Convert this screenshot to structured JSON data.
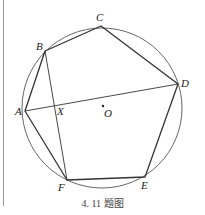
{
  "figure": {
    "caption": "4. 11 题图",
    "colors": {
      "stroke": "#333333",
      "circle": "#555555",
      "rule": "#9a9a9a"
    },
    "circle": {
      "center": "O",
      "cx": 102,
      "cy": 108,
      "r": 80
    },
    "points": {
      "A": {
        "label": "A",
        "x": 25,
        "y": 111
      },
      "B": {
        "label": "B",
        "x": 45,
        "y": 51
      },
      "C": {
        "label": "C",
        "x": 101,
        "y": 26
      },
      "D": {
        "label": "D",
        "x": 178,
        "y": 84
      },
      "E": {
        "label": "E",
        "x": 145,
        "y": 177
      },
      "F": {
        "label": "F",
        "x": 67,
        "y": 180
      },
      "X": {
        "label": "X",
        "x": 55,
        "y": 105
      },
      "O": {
        "label": "O",
        "x": 103,
        "y": 106
      }
    },
    "polygon": [
      "A",
      "B",
      "C",
      "D",
      "E",
      "F"
    ],
    "segments": [
      [
        "A",
        "D"
      ],
      [
        "B",
        "F"
      ]
    ],
    "intersection": {
      "name": "X",
      "of": [
        [
          "A",
          "D"
        ],
        [
          "B",
          "F"
        ]
      ]
    }
  }
}
